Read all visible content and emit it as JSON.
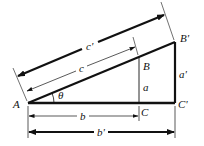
{
  "diagram": {
    "labels": {
      "A": "A",
      "B": "B",
      "B_prime": "B'",
      "C": "C",
      "C_prime": "C'",
      "a": "a",
      "a_prime": "a'",
      "b": "b",
      "b_prime": "b'",
      "c": "c",
      "c_prime": "c'",
      "theta": "θ"
    },
    "colors": {
      "stroke": "#111111",
      "background": "#ffffff"
    }
  }
}
